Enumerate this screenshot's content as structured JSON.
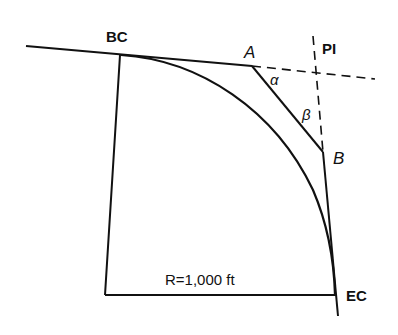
{
  "diagram": {
    "labels": {
      "bc": "BC",
      "ec": "EC",
      "pi": "PI",
      "point_a": "A",
      "point_b": "B",
      "alpha": "α",
      "beta": "β",
      "radius": "R=1,000 ft"
    },
    "colors": {
      "line": "#111111",
      "background": "#ffffff"
    }
  }
}
